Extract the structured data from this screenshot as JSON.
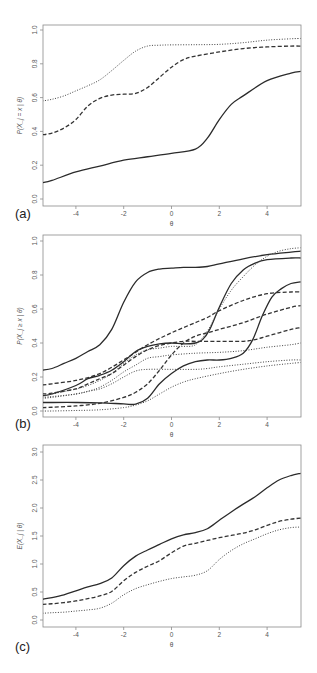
{
  "figure": {
    "panels": [
      {
        "id": "a",
        "label": "(a)",
        "xlabel": "θ",
        "ylabel": "P(X_j = x | θ)"
      },
      {
        "id": "b",
        "label": "(b)",
        "xlabel": "θ",
        "ylabel": "P(X_j ≥ x | θ)"
      },
      {
        "id": "c",
        "label": "(c)",
        "xlabel": "θ",
        "ylabel": "E(X_j | θ)"
      }
    ]
  },
  "chart_data": [
    {
      "type": "line",
      "title": "",
      "panel_label": "(a)",
      "xlabel": "θ",
      "ylabel": "P(X_j = x | θ)",
      "xlim": [
        -5.4,
        5.4
      ],
      "ylim": [
        0.0,
        1.0
      ],
      "xticks": [
        -4,
        -2,
        0,
        2,
        4
      ],
      "yticks": [
        0.0,
        0.2,
        0.4,
        0.6,
        0.8,
        1.0
      ],
      "grid": false,
      "legend": null,
      "series": [
        {
          "name": "solid",
          "style": "solid",
          "x": [
            -5.4,
            -5,
            -4,
            -3,
            -2,
            -1,
            0,
            1,
            1.5,
            2,
            2.5,
            3,
            4,
            5,
            5.4
          ],
          "y": [
            0.096,
            0.11,
            0.16,
            0.195,
            0.23,
            0.25,
            0.27,
            0.295,
            0.36,
            0.47,
            0.56,
            0.61,
            0.7,
            0.745,
            0.755
          ]
        },
        {
          "name": "dashed",
          "style": "dashed",
          "x": [
            -5.4,
            -5,
            -4.5,
            -4,
            -3.5,
            -3,
            -2.5,
            -2,
            -1.5,
            -1,
            -0.5,
            0,
            0.5,
            1,
            2,
            3,
            4,
            5,
            5.4
          ],
          "y": [
            0.38,
            0.39,
            0.42,
            0.47,
            0.55,
            0.595,
            0.615,
            0.62,
            0.625,
            0.66,
            0.72,
            0.78,
            0.825,
            0.845,
            0.87,
            0.89,
            0.9,
            0.905,
            0.905
          ]
        },
        {
          "name": "dotted",
          "style": "dotted",
          "x": [
            -5.4,
            -5,
            -4.5,
            -4,
            -3.5,
            -3,
            -2.5,
            -2,
            -1.5,
            -1,
            -0.5,
            0,
            1,
            2,
            3,
            4,
            5,
            5.4
          ],
          "y": [
            0.58,
            0.59,
            0.61,
            0.64,
            0.67,
            0.705,
            0.76,
            0.82,
            0.875,
            0.905,
            0.91,
            0.912,
            0.913,
            0.915,
            0.925,
            0.94,
            0.948,
            0.95
          ]
        }
      ]
    },
    {
      "type": "line",
      "title": "",
      "panel_label": "(b)",
      "xlabel": "θ",
      "ylabel": "P(X_j ≥ x | θ)",
      "xlim": [
        -5.4,
        5.4
      ],
      "ylim": [
        0.0,
        1.0
      ],
      "xticks": [
        -4,
        -2,
        0,
        2,
        4
      ],
      "yticks": [
        0.0,
        0.2,
        0.4,
        0.6,
        0.8,
        1.0
      ],
      "grid": false,
      "legend": null,
      "series": [
        {
          "name": "solid-1",
          "style": "solid",
          "x": [
            -5.4,
            -5,
            -4.5,
            -4,
            -3.5,
            -3,
            -2.5,
            -2,
            -1.5,
            -1,
            -0.5,
            0,
            0.5,
            1,
            1.5,
            2,
            3,
            4,
            5,
            5.4
          ],
          "y": [
            0.24,
            0.25,
            0.28,
            0.31,
            0.35,
            0.39,
            0.48,
            0.64,
            0.76,
            0.815,
            0.835,
            0.84,
            0.845,
            0.845,
            0.85,
            0.865,
            0.895,
            0.92,
            0.935,
            0.94
          ]
        },
        {
          "name": "solid-2",
          "style": "solid",
          "x": [
            -5.4,
            -5,
            -4,
            -3.5,
            -3,
            -2.5,
            -2,
            -1.5,
            -1,
            -0.5,
            0,
            0.5,
            1,
            1.3,
            1.6,
            2,
            2.5,
            3,
            3.5,
            4,
            5,
            5.4
          ],
          "y": [
            0.09,
            0.1,
            0.15,
            0.19,
            0.21,
            0.24,
            0.29,
            0.35,
            0.38,
            0.395,
            0.4,
            0.395,
            0.4,
            0.42,
            0.48,
            0.61,
            0.75,
            0.83,
            0.87,
            0.89,
            0.9,
            0.9
          ]
        },
        {
          "name": "solid-3",
          "style": "solid",
          "x": [
            -5.4,
            -5,
            -4,
            -3,
            -2,
            -1.5,
            -1,
            -0.5,
            0,
            0.5,
            1,
            1.5,
            2,
            2.5,
            3,
            3.4,
            3.8,
            4.2,
            4.6,
            5,
            5.4
          ],
          "y": [
            0.05,
            0.05,
            0.05,
            0.048,
            0.042,
            0.04,
            0.075,
            0.16,
            0.22,
            0.265,
            0.29,
            0.3,
            0.3,
            0.31,
            0.34,
            0.42,
            0.56,
            0.67,
            0.72,
            0.75,
            0.76
          ]
        },
        {
          "name": "dashed-1",
          "style": "dashed",
          "x": [
            -5.4,
            -5,
            -4,
            -3,
            -2,
            -1,
            0,
            1,
            1.5,
            2,
            3,
            4,
            5,
            5.4
          ],
          "y": [
            0.153,
            0.16,
            0.18,
            0.22,
            0.3,
            0.39,
            0.46,
            0.52,
            0.55,
            0.59,
            0.65,
            0.69,
            0.7,
            0.7
          ]
        },
        {
          "name": "dashed-2",
          "style": "dashed",
          "x": [
            -5.4,
            -5,
            -4,
            -3.5,
            -3,
            -2.5,
            -2,
            -1.5,
            -1,
            -0.5,
            0,
            0.5,
            1,
            2,
            3,
            3.5,
            4,
            4.5,
            5,
            5.4
          ],
          "y": [
            0.1,
            0.105,
            0.13,
            0.16,
            0.19,
            0.22,
            0.27,
            0.32,
            0.36,
            0.385,
            0.4,
            0.41,
            0.41,
            0.41,
            0.41,
            0.42,
            0.44,
            0.46,
            0.48,
            0.49
          ]
        },
        {
          "name": "dashed-3",
          "style": "dashed",
          "x": [
            -5.4,
            -5,
            -4,
            -3,
            -2,
            -1.5,
            -1,
            -0.5,
            0,
            0.5,
            1,
            1.5,
            2,
            3,
            4,
            5,
            5.4
          ],
          "y": [
            0.02,
            0.022,
            0.03,
            0.045,
            0.08,
            0.11,
            0.16,
            0.24,
            0.33,
            0.4,
            0.44,
            0.46,
            0.48,
            0.52,
            0.57,
            0.61,
            0.62
          ]
        },
        {
          "name": "dotted-1",
          "style": "dotted",
          "x": [
            -5.4,
            -5,
            -4,
            -3.5,
            -3,
            -2.5,
            -2,
            -1.5,
            -1,
            -0.5,
            0,
            0.5,
            1,
            1.5,
            2,
            2.5,
            3,
            3.5,
            4,
            4.5,
            5,
            5.4
          ],
          "y": [
            0.09,
            0.1,
            0.13,
            0.15,
            0.18,
            0.22,
            0.28,
            0.33,
            0.36,
            0.37,
            0.38,
            0.38,
            0.39,
            0.47,
            0.6,
            0.71,
            0.79,
            0.86,
            0.91,
            0.94,
            0.955,
            0.96
          ]
        },
        {
          "name": "dotted-2",
          "style": "dotted",
          "x": [
            -5.4,
            -5,
            -4,
            -3.4,
            -3,
            -2.5,
            -2,
            -1.5,
            -1,
            -0.5,
            0,
            1,
            2,
            3,
            4,
            5,
            5.4
          ],
          "y": [
            0.08,
            0.085,
            0.1,
            0.12,
            0.14,
            0.18,
            0.23,
            0.27,
            0.31,
            0.32,
            0.33,
            0.34,
            0.345,
            0.355,
            0.375,
            0.39,
            0.4
          ]
        },
        {
          "name": "dotted-3",
          "style": "dotted",
          "x": [
            -5.4,
            -5,
            -4,
            -3.4,
            -3,
            -2.5,
            -2,
            -1.5,
            -1,
            0,
            1,
            1.5,
            2,
            3,
            4,
            5,
            5.4
          ],
          "y": [
            0.075,
            0.08,
            0.1,
            0.118,
            0.13,
            0.16,
            0.2,
            0.235,
            0.245,
            0.245,
            0.245,
            0.25,
            0.26,
            0.275,
            0.29,
            0.3,
            0.3
          ]
        },
        {
          "name": "dotted-4",
          "style": "dotted",
          "x": [
            -5.4,
            -5,
            -4,
            -3,
            -2,
            -1.5,
            -1,
            -0.5,
            0,
            0.5,
            1,
            2,
            3,
            4,
            5,
            5.4
          ],
          "y": [
            0.0,
            0.0,
            0.003,
            0.007,
            0.02,
            0.035,
            0.06,
            0.1,
            0.14,
            0.17,
            0.19,
            0.22,
            0.245,
            0.265,
            0.28,
            0.285
          ]
        }
      ]
    },
    {
      "type": "line",
      "title": "",
      "panel_label": "(c)",
      "xlabel": "θ",
      "ylabel": "E(X_j | θ)",
      "xlim": [
        -5.4,
        5.4
      ],
      "ylim": [
        0.0,
        3.0
      ],
      "xticks": [
        -4,
        -2,
        0,
        2,
        4
      ],
      "yticks": [
        0.0,
        0.5,
        1.0,
        1.5,
        2.0,
        2.5,
        3.0
      ],
      "grid": false,
      "legend": null,
      "series": [
        {
          "name": "solid",
          "style": "solid",
          "x": [
            -5.4,
            -5,
            -4.5,
            -4,
            -3.5,
            -3,
            -2.5,
            -2,
            -1.5,
            -1,
            -0.5,
            0,
            0.5,
            1,
            1.5,
            2,
            2.5,
            3,
            3.5,
            4,
            4.5,
            5,
            5.4
          ],
          "y": [
            0.37,
            0.4,
            0.45,
            0.52,
            0.59,
            0.65,
            0.75,
            0.97,
            1.14,
            1.25,
            1.35,
            1.45,
            1.52,
            1.56,
            1.63,
            1.78,
            1.93,
            2.07,
            2.2,
            2.36,
            2.5,
            2.58,
            2.62
          ]
        },
        {
          "name": "dashed",
          "style": "dashed",
          "x": [
            -5.4,
            -5,
            -4.5,
            -4,
            -3.5,
            -3,
            -2.5,
            -2,
            -1.5,
            -1,
            -0.5,
            0,
            0.5,
            1,
            1.5,
            2,
            2.5,
            3,
            3.5,
            4,
            4.5,
            5,
            5.4
          ],
          "y": [
            0.28,
            0.29,
            0.31,
            0.34,
            0.38,
            0.43,
            0.51,
            0.7,
            0.85,
            0.96,
            1.06,
            1.2,
            1.32,
            1.37,
            1.42,
            1.47,
            1.51,
            1.55,
            1.61,
            1.69,
            1.76,
            1.8,
            1.82
          ]
        },
        {
          "name": "dotted",
          "style": "dotted",
          "x": [
            -5.4,
            -5,
            -4.5,
            -4,
            -3.5,
            -3,
            -2.5,
            -2,
            -1.5,
            -1,
            -0.5,
            0,
            0.5,
            1,
            1.5,
            2,
            2.5,
            3,
            3.5,
            4,
            4.5,
            5,
            5.4
          ],
          "y": [
            0.12,
            0.13,
            0.14,
            0.16,
            0.18,
            0.21,
            0.3,
            0.45,
            0.56,
            0.63,
            0.69,
            0.74,
            0.77,
            0.8,
            0.88,
            1.08,
            1.24,
            1.36,
            1.45,
            1.54,
            1.61,
            1.65,
            1.66
          ]
        }
      ]
    }
  ]
}
